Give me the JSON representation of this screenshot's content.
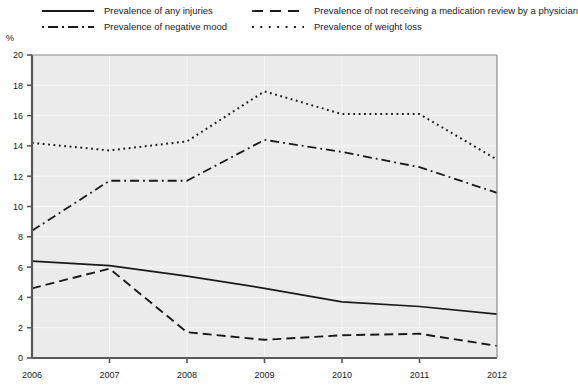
{
  "chart_data": {
    "type": "line",
    "title": "",
    "xlabel": "",
    "ylabel": "%",
    "x": [
      2006,
      2007,
      2008,
      2009,
      2010,
      2011,
      2012
    ],
    "categories": [
      "2006",
      "2007",
      "2008",
      "2009",
      "2010",
      "2011",
      "2012"
    ],
    "xlim": [
      2006,
      2012
    ],
    "ylim": [
      0,
      20
    ],
    "ytick_step": 2,
    "yticks": [
      0,
      2,
      4,
      6,
      8,
      10,
      12,
      14,
      16,
      18,
      20
    ],
    "grid": true,
    "legend_position": "top",
    "series": [
      {
        "name": "Prevalence of any injuries",
        "style": "solid",
        "color": "#1a1a1a",
        "values": [
          6.4,
          6.1,
          5.4,
          4.6,
          3.7,
          3.4,
          2.9
        ]
      },
      {
        "name": "Prevalence of not receiving a medication review by a physician",
        "style": "dashed",
        "color": "#1a1a1a",
        "values": [
          4.6,
          5.9,
          1.7,
          1.2,
          1.5,
          1.6,
          0.8
        ]
      },
      {
        "name": "Prevalence of negative mood",
        "style": "dashdot",
        "color": "#1a1a1a",
        "values": [
          8.4,
          11.7,
          11.7,
          14.4,
          13.6,
          12.6,
          10.9
        ]
      },
      {
        "name": "Prevalence of weight loss",
        "style": "dotted",
        "color": "#1a1a1a",
        "values": [
          14.2,
          13.7,
          14.3,
          17.6,
          16.1,
          16.1,
          13.1
        ]
      }
    ]
  },
  "legend": {
    "items": [
      {
        "label": "Prevalence of any injuries",
        "style": "solid"
      },
      {
        "label": "Prevalence of not receiving a medication review by a physician",
        "style": "dashed"
      },
      {
        "label": "Prevalence of negative mood",
        "style": "dashdot"
      },
      {
        "label": "Prevalence of weight loss",
        "style": "dotted"
      }
    ]
  },
  "axes": {
    "y_unit": "%",
    "y_tick_labels": [
      "20",
      "18",
      "16",
      "14",
      "12",
      "10",
      "8",
      "6",
      "4",
      "2",
      "0"
    ],
    "x_tick_labels": [
      "2006",
      "2007",
      "2008",
      "2009",
      "2010",
      "2011",
      "2012"
    ]
  },
  "colors": {
    "line": "#1a1a1a",
    "plot_background": "#ebebeb",
    "grid": "#f7f7f7",
    "axis": "#595959",
    "text": "#1a1a1a"
  }
}
